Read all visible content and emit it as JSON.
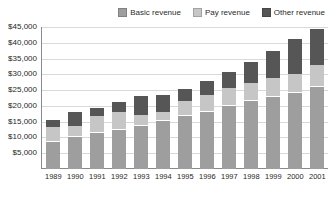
{
  "chart_data": {
    "type": "bar",
    "subtype": "stacked-bar",
    "title": "",
    "xlabel": "",
    "ylabel": "",
    "categories": [
      "1989",
      "1990",
      "1991",
      "1992",
      "1993",
      "1994",
      "1995",
      "1996",
      "1997",
      "1998",
      "1999",
      "2000",
      "2001"
    ],
    "series": [
      {
        "name": "Basic revenue",
        "color": "#9e9e9e",
        "values": [
          8500,
          10000,
          11300,
          12400,
          13500,
          15100,
          16800,
          18200,
          20100,
          21700,
          22800,
          24200,
          26000
        ]
      },
      {
        "name": "Pay revenue",
        "color": "#c6c6c6",
        "values": [
          4400,
          3400,
          5100,
          5300,
          3200,
          2700,
          4300,
          4900,
          5300,
          5400,
          5700,
          5500,
          6500
        ]
      },
      {
        "name": "Other revenue",
        "color": "#565656",
        "values": [
          2400,
          4200,
          2700,
          3300,
          6100,
          5200,
          4000,
          4600,
          5100,
          6600,
          8500,
          11300,
          11700
        ]
      }
    ],
    "totals": [
      15300,
      17600,
      19100,
      21000,
      22800,
      23000,
      25100,
      27700,
      30500,
      33700,
      37000,
      41000,
      44200
    ],
    "ylim": [
      0,
      45000
    ],
    "ytick_values": [
      5000,
      10000,
      15000,
      20000,
      25000,
      30000,
      35000,
      40000,
      45000
    ],
    "ytick_labels": [
      "$5,000",
      "$10,000",
      "$15,000",
      "$20,000",
      "$25,000",
      "$30,000",
      "$35,000",
      "$40,000",
      "$45,000"
    ],
    "grid": true,
    "grid_axis": "y",
    "legend_position": "top-right",
    "legend": [
      "Basic revenue",
      "Pay revenue",
      "Other revenue"
    ],
    "stack_separator_color": "#ffffff",
    "axis_color": "#8a8a8a",
    "gridline_color": "#d9d9d9",
    "background": "#ffffff"
  },
  "legend": {
    "entries": [
      {
        "label": "Basic revenue",
        "color": "#9e9e9e"
      },
      {
        "label": "Pay revenue",
        "color": "#c6c6c6"
      },
      {
        "label": "Other revenue",
        "color": "#565656"
      }
    ]
  }
}
